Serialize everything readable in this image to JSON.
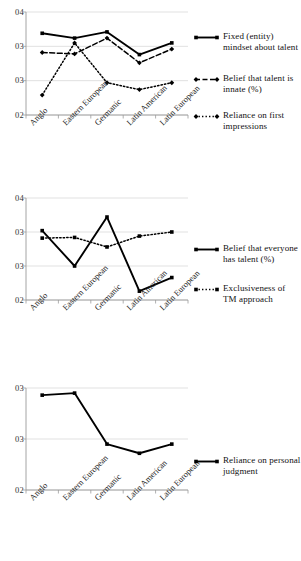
{
  "figure": {
    "panel_count": 3,
    "categories": [
      "Anglo",
      "Eastern European",
      "Germanic",
      "Latin American",
      "Latin European"
    ]
  },
  "chart_data": [
    {
      "type": "line",
      "panel": 1,
      "title": "",
      "xlabel": "",
      "ylabel": "",
      "grid": true,
      "legend_position": "right",
      "categories": [
        "Anglo",
        "Eastern European",
        "Germanic",
        "Latin American",
        "Latin European"
      ],
      "yticks": [
        "04",
        "03",
        "03",
        "02"
      ],
      "ytick_values": [
        4.0,
        3.5,
        3.0,
        2.5
      ],
      "ylim": [
        2.5,
        4.0
      ],
      "series": [
        {
          "name": "Fixed (entity) mindset about talent",
          "style": "solid",
          "marker": "square",
          "color": "#000000",
          "values": [
            3.69,
            3.62,
            3.71,
            3.38,
            3.55
          ]
        },
        {
          "name": "Belief that talent is innate (%)",
          "style": "dashed",
          "marker": "diamond",
          "color": "#000000",
          "values": [
            3.41,
            3.39,
            3.62,
            3.26,
            3.46
          ]
        },
        {
          "name": "Reliance on first impressions",
          "style": "dotted",
          "marker": "diamond",
          "color": "#000000",
          "values": [
            2.79,
            3.55,
            2.97,
            2.87,
            2.97
          ]
        }
      ]
    },
    {
      "type": "line",
      "panel": 2,
      "title": "",
      "xlabel": "",
      "ylabel": "",
      "grid": true,
      "legend_position": "right",
      "categories": [
        "Anglo",
        "Eastern European",
        "Germanic",
        "Latin American",
        "Latin European"
      ],
      "yticks": [
        "04",
        "03",
        "03",
        "02"
      ],
      "ytick_values": [
        4.0,
        3.5,
        3.0,
        2.5
      ],
      "ylim": [
        2.3,
        4.0
      ],
      "series": [
        {
          "name": "Belief that everyone has talent (%)",
          "style": "solid",
          "marker": "square",
          "color": "#000000",
          "values": [
            3.52,
            3.0,
            3.72,
            2.63,
            2.83
          ]
        },
        {
          "name": "Exclusiveness of TM approach",
          "style": "dotted",
          "marker": "square",
          "color": "#000000",
          "values": [
            3.41,
            3.42,
            3.28,
            3.44,
            3.5
          ]
        }
      ]
    },
    {
      "type": "line",
      "panel": 3,
      "title": "",
      "xlabel": "",
      "ylabel": "",
      "grid": true,
      "legend_position": "right",
      "categories": [
        "Anglo",
        "Eastern European",
        "Germanic",
        "Latin American",
        "Latin European"
      ],
      "yticks": [
        "03",
        "03",
        "02"
      ],
      "ytick_values": [
        3.5,
        3.0,
        2.5
      ],
      "ylim": [
        2.5,
        3.5
      ],
      "series": [
        {
          "name": "Reliance on personal judgment",
          "style": "solid",
          "marker": "square",
          "color": "#000000",
          "values": [
            3.43,
            3.45,
            2.95,
            2.86,
            2.95
          ]
        }
      ]
    }
  ]
}
